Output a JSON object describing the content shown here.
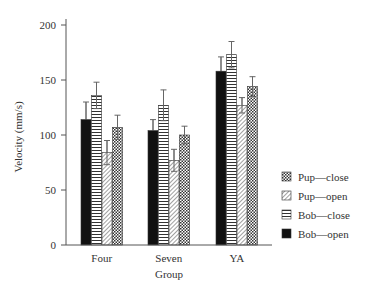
{
  "chart_data": {
    "type": "bar",
    "title": "",
    "xlabel": "Group",
    "ylabel": "Velocity (mm/s)",
    "ylim": [
      0,
      200
    ],
    "yticks": [
      0,
      50,
      100,
      150,
      200
    ],
    "categories": [
      "Four",
      "Seven",
      "YA"
    ],
    "series": [
      {
        "name": "Bob—open",
        "pattern": "solid",
        "values": [
          114,
          104,
          158
        ],
        "errors": [
          16,
          10,
          13
        ]
      },
      {
        "name": "Bob—close",
        "pattern": "horizontal",
        "values": [
          136,
          127,
          173
        ],
        "errors": [
          12,
          14,
          12
        ]
      },
      {
        "name": "Pup—open",
        "pattern": "diagonal",
        "values": [
          84,
          77,
          127
        ],
        "errors": [
          11,
          10,
          7
        ]
      },
      {
        "name": "Pup—close",
        "pattern": "checker",
        "values": [
          107,
          100,
          144
        ],
        "errors": [
          11,
          8,
          9
        ]
      }
    ],
    "legend": {
      "position": "right",
      "entries": [
        "Pup—close",
        "Pup—open",
        "Bob—close",
        "Bob—open"
      ]
    },
    "grid": false
  }
}
